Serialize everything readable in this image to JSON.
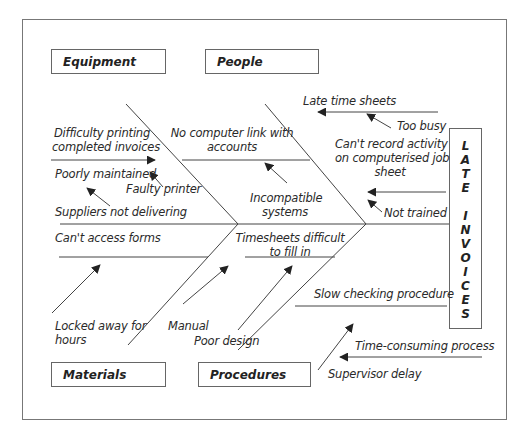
{
  "effect": {
    "label": "LATE INVOICES",
    "letters": [
      "L",
      "A",
      "T",
      "E",
      "",
      "I",
      "N",
      "V",
      "O",
      "I",
      "C",
      "E",
      "S"
    ]
  },
  "categories": {
    "equipment": "Equipment",
    "people": "People",
    "materials": "Materials",
    "procedures": "Procedures"
  },
  "causes": {
    "equipment": {
      "difficulty_printing_1": "Difficulty printing",
      "difficulty_printing_2": "completed invoices",
      "poorly_maintained": "Poorly maintained",
      "faulty_printer": "Faulty printer",
      "suppliers_not_delivering": "Suppliers not delivering"
    },
    "people": {
      "no_computer_link_1": "No computer link with",
      "no_computer_link_2": "accounts",
      "incompatible_1": "Incompatible",
      "incompatible_2": "systems",
      "late_time_sheets": "Late time sheets",
      "too_busy": "Too busy",
      "cant_record_1": "Can't record activity",
      "cant_record_2": "on computerised job",
      "cant_record_3": "sheet",
      "not_trained": "Not trained"
    },
    "materials": {
      "cant_access_forms": "Can't access forms",
      "locked_away_1": "Locked away for",
      "locked_away_2": "hours"
    },
    "procedures": {
      "timesheets_difficult_1": "Timesheets difficult",
      "timesheets_difficult_2": "to fill in",
      "manual": "Manual",
      "poor_design": "Poor design",
      "slow_checking": "Slow checking procedure",
      "time_consuming": "Time-consuming process",
      "supervisor_delay": "Supervisor delay"
    }
  },
  "colors": {
    "line": "#444444",
    "frame": "#777777",
    "text": "#222222"
  }
}
